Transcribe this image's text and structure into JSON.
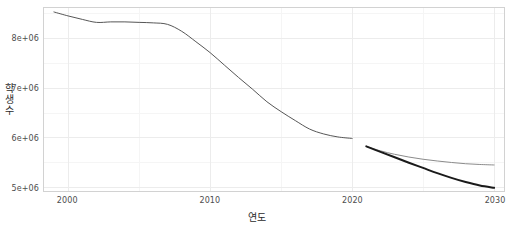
{
  "chart_data": {
    "type": "line",
    "title": "",
    "xlabel": "연도",
    "ylabel": "학생수",
    "xlim": [
      1998.3,
      2030.7
    ],
    "ylim": [
      4930000,
      8620000
    ],
    "grid": true,
    "legend": false,
    "x_ticks": [
      2000,
      2010,
      2020,
      2030
    ],
    "x_tick_labels": [
      "2000",
      "2010",
      "2020",
      "2030"
    ],
    "y_ticks": [
      5000000,
      6000000,
      7000000,
      8000000
    ],
    "y_tick_labels": [
      "5e+06",
      "6e+06",
      "7e+06",
      "8e+06"
    ],
    "x_minor_ticks": [
      2005,
      2015,
      2025
    ],
    "y_minor_ticks": [
      5500000,
      6500000,
      7500000,
      8500000
    ],
    "series": [
      {
        "name": "historical",
        "color": "#555555",
        "width": 1.0,
        "x": [
          1999,
          2000,
          2001,
          2002,
          2003,
          2004,
          2005,
          2006,
          2007,
          2008,
          2009,
          2010,
          2011,
          2012,
          2013,
          2014,
          2015,
          2016,
          2017,
          2018,
          2019,
          2020
        ],
        "values": [
          8540000,
          8460000,
          8390000,
          8330000,
          8340000,
          8340000,
          8330000,
          8320000,
          8290000,
          8150000,
          7940000,
          7720000,
          7470000,
          7220000,
          6980000,
          6730000,
          6530000,
          6350000,
          6180000,
          6080000,
          6020000,
          5990000
        ]
      },
      {
        "name": "forecast-high",
        "color": "#8a8a8a",
        "width": 1.0,
        "x": [
          2021,
          2022,
          2023,
          2024,
          2025,
          2026,
          2027,
          2028,
          2029,
          2030
        ],
        "values": [
          5830000,
          5740000,
          5670000,
          5615000,
          5570000,
          5535000,
          5505000,
          5480000,
          5465000,
          5455000
        ]
      },
      {
        "name": "forecast-low",
        "color": "#1a1a1a",
        "width": 2.0,
        "x": [
          2021,
          2022,
          2023,
          2024,
          2025,
          2026,
          2027,
          2028,
          2029,
          2030
        ],
        "values": [
          5830000,
          5720000,
          5610000,
          5500000,
          5395000,
          5290000,
          5195000,
          5110000,
          5040000,
          4995000
        ]
      }
    ],
    "colors": {
      "panel_background": "#ffffff",
      "panel_border": "#d2d2d2",
      "major_grid": "#ececec",
      "minor_grid": "#f5f5f5",
      "tick_text": "#4d4d4d",
      "axis_title_text": "#2b2b2b"
    }
  },
  "axes": {
    "y_title_chars": [
      "학",
      "생",
      "수"
    ]
  }
}
